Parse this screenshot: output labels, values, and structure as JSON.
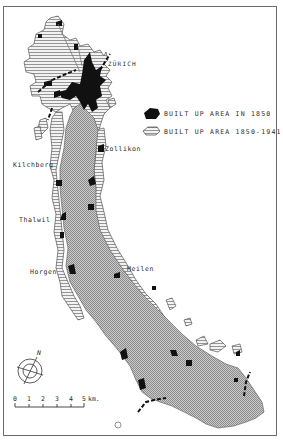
{
  "map": {
    "title": "",
    "lake": "Lake Zürich",
    "colors": {
      "built_1850": "#111111",
      "built_1850_1941": "#d9d9d9",
      "lake": "#b8b8b8",
      "frame": "#6a6a6a"
    }
  },
  "places": [
    {
      "name": "ZÜRICH"
    },
    {
      "name": "Zollikon"
    },
    {
      "name": "Kilchberg"
    },
    {
      "name": "Thalwil"
    },
    {
      "name": "Horgen"
    },
    {
      "name": "Meilen"
    }
  ],
  "legend": {
    "items": [
      {
        "label": "BUILT UP AREA IN 1850",
        "symbol": "solid-black"
      },
      {
        "label": "BUILT UP AREA 1850-1941",
        "symbol": "hatched"
      }
    ]
  },
  "compass": {
    "label": "N"
  },
  "scale": {
    "ticks": [
      "0",
      "1",
      "2",
      "3",
      "4",
      "5"
    ],
    "unit": "km."
  }
}
